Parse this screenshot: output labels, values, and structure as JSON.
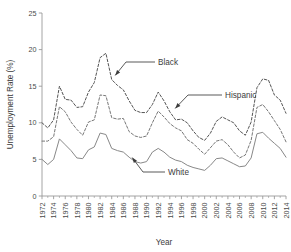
{
  "chart_data": {
    "type": "line",
    "title": "",
    "xlabel": "Year",
    "ylabel": "Unemployment Rate (%)",
    "xlim": [
      1972,
      2014
    ],
    "ylim": [
      0,
      25
    ],
    "grid": false,
    "legend_position": "inline-annotations",
    "yticks": [
      "0",
      "5",
      "10",
      "15",
      "20",
      "25"
    ],
    "ytick_values": [
      0,
      5,
      10,
      15,
      20,
      25
    ],
    "xticks": [
      "1972",
      "1974",
      "1976",
      "1978",
      "1980",
      "1982",
      "1984",
      "1986",
      "1988",
      "1990",
      "1992",
      "1994",
      "1996",
      "1998",
      "2000",
      "2002",
      "2004",
      "2006",
      "2008",
      "2010",
      "2012",
      "2014"
    ],
    "xtick_values": [
      1972,
      1974,
      1976,
      1978,
      1980,
      1982,
      1984,
      1986,
      1988,
      1990,
      1992,
      1994,
      1996,
      1998,
      2000,
      2002,
      2004,
      2006,
      2008,
      2010,
      2012,
      2014
    ],
    "x": [
      1972,
      1973,
      1974,
      1975,
      1976,
      1977,
      1978,
      1979,
      1980,
      1981,
      1982,
      1983,
      1984,
      1985,
      1986,
      1987,
      1988,
      1989,
      1990,
      1991,
      1992,
      1993,
      1994,
      1995,
      1996,
      1997,
      1998,
      1999,
      2000,
      2001,
      2002,
      2003,
      2004,
      2005,
      2006,
      2007,
      2008,
      2009,
      2010,
      2011,
      2012,
      2013,
      2014
    ],
    "series": [
      {
        "name": "Black",
        "style": "dashed",
        "color": "#555555",
        "values": [
          10.0,
          9.3,
          10.4,
          15.0,
          13.2,
          13.1,
          12.1,
          12.2,
          14.2,
          15.5,
          18.9,
          19.5,
          15.9,
          15.1,
          14.5,
          13.0,
          11.7,
          11.4,
          11.4,
          12.5,
          14.2,
          13.0,
          11.5,
          10.4,
          10.5,
          10.0,
          8.9,
          8.0,
          7.6,
          8.6,
          10.2,
          10.8,
          10.4,
          10.0,
          8.9,
          8.3,
          10.1,
          14.8,
          16.0,
          15.8,
          13.8,
          13.1,
          11.3
        ]
      },
      {
        "name": "Hispanic",
        "style": "dashed",
        "color": "#777777",
        "values": [
          7.5,
          7.5,
          8.1,
          12.2,
          11.5,
          10.1,
          9.1,
          8.3,
          10.1,
          10.4,
          13.8,
          13.7,
          10.7,
          10.5,
          10.6,
          8.8,
          8.2,
          8.0,
          8.2,
          10.0,
          11.6,
          10.8,
          9.9,
          9.3,
          8.9,
          7.7,
          7.2,
          6.4,
          5.7,
          6.6,
          7.5,
          7.7,
          7.0,
          6.0,
          5.2,
          5.6,
          7.6,
          12.1,
          12.5,
          11.5,
          10.3,
          9.1,
          7.4
        ]
      },
      {
        "name": "White",
        "style": "solid",
        "color": "#888888",
        "values": [
          5.0,
          4.3,
          5.0,
          7.8,
          7.0,
          6.2,
          5.2,
          5.1,
          6.3,
          6.7,
          8.6,
          8.4,
          6.5,
          6.2,
          6.0,
          5.3,
          4.7,
          4.5,
          4.7,
          6.0,
          6.5,
          6.0,
          5.3,
          4.9,
          4.7,
          4.2,
          3.9,
          3.7,
          3.5,
          4.2,
          5.1,
          5.2,
          4.8,
          4.4,
          4.0,
          4.1,
          5.2,
          8.5,
          8.7,
          7.9,
          7.2,
          6.5,
          5.3
        ]
      }
    ],
    "annotations": [
      {
        "label": "Black",
        "target_x": 1984,
        "target_y": 15.9
      },
      {
        "label": "Hispanic",
        "target_x": 1992,
        "target_y": 11.6
      },
      {
        "label": "White",
        "target_x": 1990,
        "target_y": 4.7
      }
    ]
  }
}
